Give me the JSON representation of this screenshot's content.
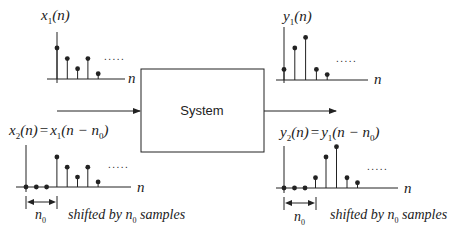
{
  "diagram": {
    "type": "block-diagram",
    "system_block": {
      "label": "System"
    },
    "input_top": {
      "label_var": "x",
      "label_sub": "1",
      "label_arg": "(n)",
      "axis_label": "n",
      "samples": [
        1.0,
        0.66,
        0.33,
        0.66,
        0.17
      ],
      "continuation": "....."
    },
    "output_top": {
      "label_var": "y",
      "label_sub": "1",
      "label_arg": "(n)",
      "axis_label": "n",
      "samples": [
        0.33,
        1.0,
        1.33,
        0.33,
        0.17
      ],
      "continuation": "....."
    },
    "input_bottom": {
      "label_lhs_var": "x",
      "label_lhs_sub": "2",
      "label_lhs_arg": "(n)",
      "label_eq": "=",
      "label_rhs_var": "x",
      "label_rhs_sub": "1",
      "label_rhs_arg_open": "(n − n",
      "label_rhs_arg_sub": "0",
      "label_rhs_arg_close": ")",
      "axis_label": "n",
      "leading_zeros": 3,
      "samples": [
        1.0,
        0.66,
        0.33,
        0.66,
        0.17
      ],
      "continuation": ".....",
      "shift_label_var": "n",
      "shift_label_sub": "0",
      "shift_caption_pre": "shifted by n",
      "shift_caption_sub": "0",
      "shift_caption_post": " samples"
    },
    "output_bottom": {
      "label_lhs_var": "y",
      "label_lhs_sub": "2",
      "label_lhs_arg": "(n)",
      "label_eq": "=",
      "label_rhs_var": "y",
      "label_rhs_sub": "1",
      "label_rhs_arg_open": "(n − n",
      "label_rhs_arg_sub": "0",
      "label_rhs_arg_close": ")",
      "axis_label": "n",
      "leading_zeros": 3,
      "samples": [
        0.33,
        1.0,
        1.33,
        0.33,
        0.17
      ],
      "continuation": ".....",
      "shift_label_var": "n",
      "shift_label_sub": "0",
      "shift_caption_pre": "shifted by n",
      "shift_caption_sub": "0",
      "shift_caption_post": " samples"
    },
    "colors": {
      "line": "#222222",
      "background": "#ffffff"
    }
  }
}
